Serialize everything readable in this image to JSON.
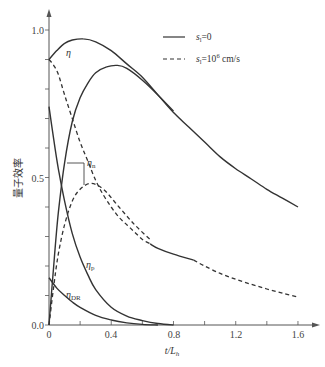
{
  "chart_data": {
    "type": "line",
    "title": "",
    "xlabel": "t/L_h",
    "ylabel": "量子效率",
    "xlim": [
      0,
      1.7
    ],
    "ylim": [
      0,
      1.05
    ],
    "x_ticks": [
      0,
      0.4,
      0.8,
      1.2,
      1.6
    ],
    "x_tick_labels": [
      "0",
      "0.4",
      "0.8",
      "1.2",
      "1.6"
    ],
    "x_minor_step": 0.2,
    "y_ticks": [
      0.0,
      0.5,
      1.0
    ],
    "y_tick_labels": [
      "0.0",
      "0.5",
      "1.0"
    ],
    "y_minor_step": 0.1,
    "grid": false,
    "legend": {
      "position": "upper right",
      "entries": [
        {
          "label": "s_l=0",
          "style": "solid"
        },
        {
          "label": "s_l=10^6 cm/s",
          "style": "dashed"
        }
      ]
    },
    "series": [
      {
        "name": "η (s_l=0)",
        "style": "solid",
        "x": [
          0,
          0.05,
          0.1,
          0.15,
          0.22,
          0.3,
          0.4,
          0.5,
          0.6,
          0.7,
          0.8,
          0.9,
          1.0,
          1.1,
          1.2,
          1.3,
          1.4,
          1.5,
          1.6
        ],
        "y": [
          0.9,
          0.93,
          0.955,
          0.966,
          0.97,
          0.96,
          0.93,
          0.885,
          0.84,
          0.78,
          0.72,
          0.67,
          0.62,
          0.57,
          0.53,
          0.495,
          0.46,
          0.43,
          0.4
        ]
      },
      {
        "name": "η_n (s_l=0)",
        "style": "solid",
        "x": [
          0,
          0.03,
          0.06,
          0.1,
          0.15,
          0.2,
          0.25,
          0.3,
          0.37,
          0.44,
          0.5,
          0.6,
          0.7,
          0.8
        ],
        "y": [
          0.0,
          0.2,
          0.38,
          0.55,
          0.69,
          0.77,
          0.82,
          0.855,
          0.875,
          0.88,
          0.87,
          0.83,
          0.78,
          0.725
        ]
      },
      {
        "name": "η (s_l=10^6 cm/s)",
        "style": "dashed",
        "x": [
          0,
          0.03,
          0.06,
          0.1,
          0.15,
          0.2,
          0.25,
          0.3,
          0.35,
          0.4,
          0.45,
          0.5,
          0.55,
          0.6,
          0.65
        ],
        "y": [
          0.9,
          0.88,
          0.85,
          0.78,
          0.7,
          0.62,
          0.555,
          0.49,
          0.44,
          0.4,
          0.365,
          0.34,
          0.315,
          0.29,
          0.275
        ]
      },
      {
        "name": "η_n (s_l=10^6 cm/s)",
        "style": "dashed",
        "x": [
          0,
          0.03,
          0.06,
          0.1,
          0.15,
          0.2,
          0.27,
          0.35,
          0.45,
          0.55,
          0.65
        ],
        "y": [
          0.0,
          0.13,
          0.24,
          0.34,
          0.42,
          0.46,
          0.48,
          0.46,
          0.4,
          0.34,
          0.29
        ]
      },
      {
        "name": "η (s_l=10^6 cm/s) merged tail",
        "style": "solid",
        "x": [
          0.65,
          0.7,
          0.8,
          0.93
        ],
        "y": [
          0.275,
          0.26,
          0.24,
          0.22
        ]
      },
      {
        "name": "η (s_l=10^6 cm/s) far tail",
        "style": "dashed",
        "x": [
          0.93,
          1.0,
          1.1,
          1.2,
          1.3,
          1.4,
          1.5,
          1.6
        ],
        "y": [
          0.22,
          0.2,
          0.175,
          0.155,
          0.138,
          0.122,
          0.108,
          0.095
        ]
      },
      {
        "name": "η_p",
        "style": "solid",
        "x": [
          0,
          0.03,
          0.06,
          0.1,
          0.15,
          0.2,
          0.25,
          0.3,
          0.4,
          0.5,
          0.6,
          0.7,
          0.8
        ],
        "y": [
          0.74,
          0.63,
          0.53,
          0.42,
          0.31,
          0.23,
          0.17,
          0.12,
          0.06,
          0.03,
          0.015,
          0.005,
          0.0
        ]
      },
      {
        "name": "η_DR",
        "style": "solid",
        "x": [
          0,
          0.05,
          0.1,
          0.15,
          0.2,
          0.3,
          0.4,
          0.5,
          0.6,
          0.7
        ],
        "y": [
          0.16,
          0.125,
          0.1,
          0.078,
          0.06,
          0.033,
          0.017,
          0.007,
          0.002,
          0.0
        ]
      }
    ],
    "annotations": [
      {
        "text": "η",
        "x": 0.13,
        "y": 0.9
      },
      {
        "text": "η_n",
        "x": 0.25,
        "y": 0.55,
        "note": "bracket spanning s_l=0 and s_l=10^6 η_n curves"
      },
      {
        "text": "η_p",
        "x": 0.25,
        "y": 0.23
      },
      {
        "text": "η_DR",
        "x": 0.1,
        "y": 0.11
      }
    ]
  },
  "labels": {
    "y_axis_title": "量子效率",
    "x_axis_title_main": "t/L",
    "x_axis_title_sub": "h",
    "y_ticks": [
      "0.0",
      "0.5",
      "1.0"
    ],
    "x_ticks": [
      "0",
      "0.4",
      "0.8",
      "1.2",
      "1.6"
    ],
    "legend_solid_s": "s",
    "legend_solid_sub": "l",
    "legend_solid_rest": "=0",
    "legend_dashed_s": "s",
    "legend_dashed_sub": "l",
    "legend_dashed_rest1": "=10",
    "legend_dashed_sup": "6",
    "legend_dashed_rest2": " cm/s",
    "eta": "η",
    "eta_n_main": "η",
    "eta_n_sub": "n",
    "eta_p_main": "η",
    "eta_p_sub": "p",
    "eta_dr_main": "η",
    "eta_dr_sub": "DR"
  }
}
